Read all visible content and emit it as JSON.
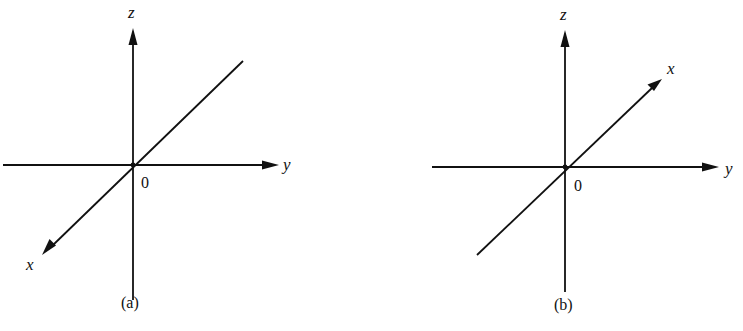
{
  "figure": {
    "panels": [
      {
        "id": "a",
        "caption": "(a)",
        "origin_label": "0",
        "axes": {
          "z": {
            "label": "z",
            "direction": "up"
          },
          "y": {
            "label": "y",
            "direction": "right"
          },
          "x": {
            "label": "x",
            "direction": "toward viewer, lower-left"
          }
        }
      },
      {
        "id": "b",
        "caption": "(b)",
        "origin_label": "0",
        "axes": {
          "z": {
            "label": "z",
            "direction": "up"
          },
          "y": {
            "label": "y",
            "direction": "right"
          },
          "x": {
            "label": "x",
            "direction": "away from viewer, upper-right"
          }
        }
      }
    ]
  },
  "colors": {
    "ink": "#111111",
    "background": "#ffffff"
  }
}
